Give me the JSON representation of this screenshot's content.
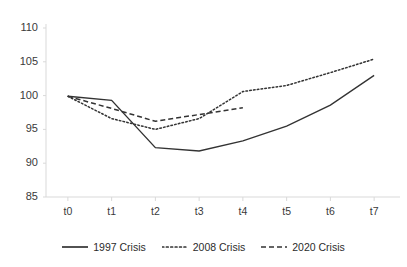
{
  "chart_data": {
    "type": "line",
    "title": "",
    "subtitle": "",
    "xlabel": "",
    "ylabel": "",
    "x": [
      "t0",
      "t1",
      "t2",
      "t3",
      "t4",
      "t5",
      "t6",
      "t7"
    ],
    "categories": [
      "t0",
      "t1",
      "t2",
      "t3",
      "t4",
      "t5",
      "t6",
      "t7"
    ],
    "ylim": [
      85,
      110
    ],
    "yticks": [
      85,
      90,
      95,
      100,
      105,
      110
    ],
    "ytick_labels": [
      "85",
      "90",
      "95",
      "100",
      "105",
      "110"
    ],
    "xtick_labels": [
      "t0",
      "t1",
      "t2",
      "t3",
      "t4",
      "t5",
      "t6",
      "t7"
    ],
    "grid": false,
    "legend_position": "bottom",
    "series": [
      {
        "name": "1997 Crisis",
        "style": "solid",
        "color": "#333333",
        "values": [
          99.9,
          99.3,
          92.3,
          91.8,
          93.3,
          95.5,
          98.6,
          103.0
        ]
      },
      {
        "name": "2008 Crisis",
        "style": "dotted",
        "color": "#333333",
        "values": [
          99.9,
          96.6,
          95.0,
          96.6,
          100.6,
          101.5,
          103.4,
          105.4
        ]
      },
      {
        "name": "2020 Crisis",
        "style": "dashed",
        "color": "#333333",
        "values": [
          99.9,
          98.1,
          96.2,
          97.2,
          98.2,
          null,
          null,
          null
        ]
      }
    ]
  },
  "legend": {
    "entries": [
      {
        "label": "1997 Crisis",
        "style": "solid"
      },
      {
        "label": "2008 Crisis",
        "style": "dotted"
      },
      {
        "label": "2020 Crisis",
        "style": "dashed"
      }
    ]
  },
  "colors": {
    "line": "#333333",
    "axis": "#d9d9d9",
    "text": "#3a3a3a",
    "background": "#ffffff"
  }
}
